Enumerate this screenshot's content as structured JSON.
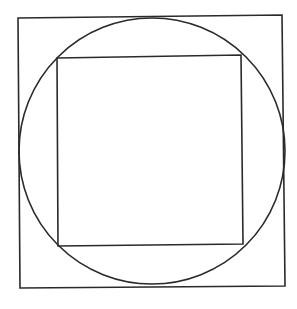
{
  "diagram": {
    "stroke_color": "#2a2a2a",
    "background": "#ffffff",
    "outer_square": {
      "points": "18,18 282,15 285,286 20,288"
    },
    "circle": {
      "cx": 152,
      "cy": 151,
      "r": 133
    },
    "inner_square": {
      "points": "57,58 241,55 243,244 58,246"
    }
  }
}
